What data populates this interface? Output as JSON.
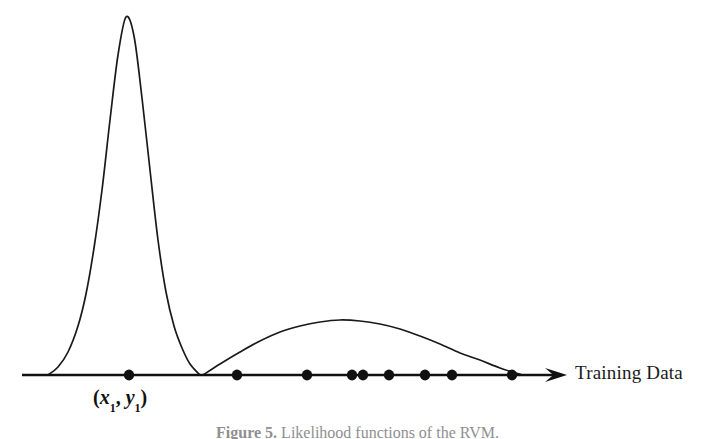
{
  "figure": {
    "background_color": "#ffffff",
    "ink_color": "#1a1a1a",
    "axis_label": "Training Data",
    "point_label_open": "(",
    "point_label_x": "x",
    "point_label_x_sub": "1",
    "point_label_comma": ", ",
    "point_label_y": "y",
    "point_label_y_sub": "1",
    "point_label_close": ")",
    "caption_number": "Figure 5.",
    "caption_text": "Likelihood functions of the RVM."
  },
  "chart_data": {
    "type": "line",
    "title": "Likelihood functions of the RVM",
    "xlabel": "Training Data",
    "ylabel": "",
    "grid": false,
    "legend": "none",
    "axis": {
      "baseline_y": 375,
      "x_start": 22,
      "x_end": 567,
      "arrow_tip_x": 567,
      "arrow_head_length": 22,
      "arrow_head_halfwidth": 7,
      "line_width": 2.4
    },
    "xlim": [
      22,
      567
    ],
    "ylim": [
      17,
      375
    ],
    "annotations": [
      {
        "name": "first-point-label",
        "text": "(x1, y1)",
        "x": 129,
        "y": 396,
        "points_to": 129
      },
      {
        "name": "axis-arrow-label",
        "text": "Training Data",
        "x": 575,
        "y": 375
      }
    ],
    "series": [
      {
        "name": "narrow-peaked-likelihood",
        "description": "Tall narrow peaked likelihood function centred on the first training point",
        "peak_x": 126,
        "peak_y": 17,
        "peak_height": 358,
        "left_foot_x": 48,
        "right_foot_x": 200,
        "halfwidth": 76,
        "points": [
          [
            48,
            375
          ],
          [
            58,
            367
          ],
          [
            68,
            352
          ],
          [
            78,
            326
          ],
          [
            86,
            294
          ],
          [
            94,
            248
          ],
          [
            102,
            190
          ],
          [
            110,
            120
          ],
          [
            118,
            55
          ],
          [
            126,
            17
          ],
          [
            134,
            36
          ],
          [
            142,
            98
          ],
          [
            150,
            170
          ],
          [
            158,
            240
          ],
          [
            166,
            292
          ],
          [
            174,
            326
          ],
          [
            182,
            348
          ],
          [
            190,
            364
          ],
          [
            200,
            375
          ]
        ]
      },
      {
        "name": "broad-flat-likelihood",
        "description": "Wide shallow likelihood function spanning the remaining training points",
        "peak_x": 340,
        "peak_y": 320,
        "peak_height": 55,
        "left_foot_x": 203,
        "right_foot_x": 522,
        "halfwidth": 160,
        "points": [
          [
            203,
            375
          ],
          [
            220,
            364
          ],
          [
            240,
            352
          ],
          [
            260,
            341
          ],
          [
            280,
            332
          ],
          [
            300,
            326
          ],
          [
            320,
            322
          ],
          [
            340,
            320
          ],
          [
            360,
            321
          ],
          [
            380,
            324
          ],
          [
            400,
            329
          ],
          [
            420,
            336
          ],
          [
            440,
            344
          ],
          [
            460,
            353
          ],
          [
            480,
            360
          ],
          [
            500,
            368
          ],
          [
            522,
            375
          ]
        ]
      }
    ],
    "data_points": {
      "name": "training-data-points",
      "marker": "filled-circle",
      "marker_radius": 5.2,
      "y": 375,
      "count": 9,
      "x_values": [
        129,
        237,
        307,
        352,
        363,
        389,
        425,
        452,
        512
      ],
      "labels": [
        "(x1, y1)",
        "",
        "",
        "",
        "",
        "",
        "",
        "",
        ""
      ]
    }
  }
}
